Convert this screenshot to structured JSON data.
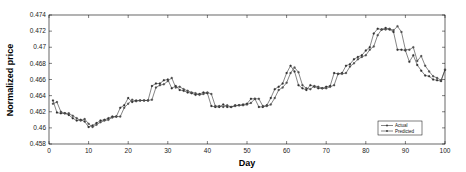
{
  "chart_data": {
    "type": "line",
    "title": "",
    "xlabel": "Day",
    "ylabel": "Normalized price",
    "xlim": [
      0,
      100
    ],
    "ylim": [
      0.458,
      0.474
    ],
    "xticks": [
      "0",
      "10",
      "20",
      "30",
      "40",
      "50",
      "60",
      "70",
      "80",
      "90",
      "100"
    ],
    "yticks": [
      "0.458",
      "0.46",
      "0.462",
      "0.464",
      "0.466",
      "0.468",
      "0.47",
      "0.472",
      "0.474"
    ],
    "grid": false,
    "legend_position": "lower right",
    "x": [
      1,
      2,
      3,
      4,
      5,
      6,
      7,
      8,
      9,
      10,
      11,
      12,
      13,
      14,
      15,
      16,
      17,
      18,
      19,
      20,
      21,
      22,
      23,
      24,
      25,
      26,
      27,
      28,
      29,
      30,
      31,
      32,
      33,
      34,
      35,
      36,
      37,
      38,
      39,
      40,
      41,
      42,
      43,
      44,
      45,
      46,
      47,
      48,
      49,
      50,
      51,
      52,
      53,
      54,
      55,
      56,
      57,
      58,
      59,
      60,
      61,
      62,
      63,
      64,
      65,
      66,
      67,
      68,
      69,
      70,
      71,
      72,
      73,
      74,
      75,
      76,
      77,
      78,
      79,
      80,
      81,
      82,
      83,
      84,
      85,
      86,
      87,
      88,
      89,
      90,
      91,
      92,
      93,
      94,
      95,
      96,
      97,
      98,
      99,
      100
    ],
    "series": [
      {
        "name": "Actual",
        "values": [
          0.4634,
          0.4619,
          0.4618,
          0.4618,
          0.4616,
          0.4612,
          0.4609,
          0.461,
          0.4608,
          0.4601,
          0.4603,
          0.4606,
          0.4609,
          0.461,
          0.4612,
          0.4614,
          0.4614,
          0.4625,
          0.4628,
          0.4637,
          0.4632,
          0.4634,
          0.4634,
          0.4634,
          0.4634,
          0.4652,
          0.4655,
          0.4655,
          0.4659,
          0.466,
          0.4649,
          0.4652,
          0.4647,
          0.4646,
          0.4644,
          0.4643,
          0.4641,
          0.4642,
          0.4644,
          0.4643,
          0.4627,
          0.4626,
          0.4626,
          0.4629,
          0.4626,
          0.4626,
          0.4628,
          0.4628,
          0.4629,
          0.463,
          0.4636,
          0.4636,
          0.4626,
          0.4626,
          0.4628,
          0.4637,
          0.4648,
          0.4651,
          0.4655,
          0.4668,
          0.4677,
          0.467,
          0.4653,
          0.4649,
          0.4647,
          0.4653,
          0.4651,
          0.4649,
          0.4649,
          0.4651,
          0.4652,
          0.4668,
          0.4667,
          0.4668,
          0.4677,
          0.4679,
          0.4685,
          0.4688,
          0.469,
          0.4696,
          0.47,
          0.4717,
          0.4723,
          0.4722,
          0.4724,
          0.4722,
          0.4719,
          0.4697,
          0.4697,
          0.4696,
          0.4682,
          0.469,
          0.4678,
          0.4671,
          0.4665,
          0.4664,
          0.466,
          0.4659,
          0.4658,
          0.4672
        ]
      },
      {
        "name": "Predicted",
        "values": [
          0.463,
          0.4632,
          0.462,
          0.4618,
          0.4618,
          0.4615,
          0.4612,
          0.4609,
          0.4611,
          0.4605,
          0.4601,
          0.4604,
          0.4607,
          0.4609,
          0.461,
          0.4613,
          0.4614,
          0.4614,
          0.4625,
          0.463,
          0.4635,
          0.4633,
          0.4634,
          0.4634,
          0.4634,
          0.4635,
          0.465,
          0.4653,
          0.4654,
          0.4658,
          0.4662,
          0.465,
          0.4651,
          0.4648,
          0.4646,
          0.4644,
          0.4643,
          0.4641,
          0.4642,
          0.4644,
          0.4642,
          0.4627,
          0.4627,
          0.4626,
          0.4628,
          0.4626,
          0.4627,
          0.4628,
          0.4628,
          0.4629,
          0.4631,
          0.4636,
          0.4636,
          0.4627,
          0.4627,
          0.4629,
          0.4637,
          0.4647,
          0.465,
          0.4656,
          0.4668,
          0.4675,
          0.4669,
          0.4653,
          0.4649,
          0.4648,
          0.4652,
          0.4651,
          0.4649,
          0.4649,
          0.4651,
          0.4653,
          0.4667,
          0.4667,
          0.4668,
          0.4676,
          0.468,
          0.4685,
          0.4688,
          0.469,
          0.4697,
          0.4701,
          0.4715,
          0.4722,
          0.4722,
          0.4723,
          0.4721,
          0.4726,
          0.4719,
          0.4697,
          0.4697,
          0.47,
          0.4683,
          0.4689,
          0.4677,
          0.467,
          0.4664,
          0.4662,
          0.4659,
          0.4672
        ]
      }
    ]
  },
  "legend": {
    "items": [
      {
        "label": "Actual",
        "marker": "star"
      },
      {
        "label": "Predicted",
        "marker": "circle"
      }
    ]
  },
  "colors": {
    "line": "#333333",
    "axis": "#000000",
    "background": "#ffffff"
  }
}
